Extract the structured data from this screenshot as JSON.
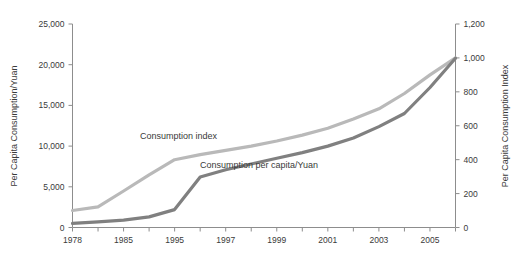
{
  "chart_data": {
    "type": "line",
    "title": "",
    "xlabel": "",
    "ylabel": "Per Capita Consumption/Yuan",
    "y2label": "Per Capita Consumption Index",
    "grid": false,
    "legend_position": "inline-annotations",
    "ylim": [
      0,
      25000
    ],
    "y2lim": [
      0,
      1200
    ],
    "y_ticks": [
      "0",
      "5,000",
      "10,000",
      "15,000",
      "20,000",
      "25,000"
    ],
    "y_tick_values": [
      0,
      5000,
      10000,
      15000,
      20000,
      25000
    ],
    "y2_ticks": [
      "0",
      "200",
      "400",
      "600",
      "800",
      "1,000",
      "1,200"
    ],
    "y2_tick_values": [
      0,
      200,
      400,
      600,
      800,
      1000,
      1200
    ],
    "x_tick_labels": [
      "1978",
      "",
      "1985",
      "",
      "1995",
      "",
      "1997",
      "",
      "1999",
      "",
      "2001",
      "",
      "2003",
      "",
      "2005",
      ""
    ],
    "categories": [
      "1978",
      "1982",
      "1985",
      "1990",
      "1995",
      "1996",
      "1997",
      "1998",
      "1999",
      "2000",
      "2001",
      "2002",
      "2003",
      "2004",
      "2005",
      "2006"
    ],
    "series": [
      {
        "name": "Consumption index",
        "axis": "right",
        "color": "#b9b9b9",
        "values": [
          100,
          122,
          215,
          310,
          400,
          430,
          455,
          480,
          510,
          545,
          585,
          640,
          700,
          790,
          900,
          1000
        ]
      },
      {
        "name": "Consumption per capita/Yuan",
        "axis": "left",
        "color": "#808080",
        "values": [
          500,
          700,
          900,
          1300,
          2200,
          6200,
          7100,
          7800,
          8500,
          9200,
          10000,
          11000,
          12400,
          14000,
          17200,
          20800
        ]
      }
    ],
    "annotations": [
      {
        "text": "Consumption index",
        "x_px": 140,
        "y_px": 139
      },
      {
        "text": "Consumption per capita/Yuan",
        "x_px": 200,
        "y_px": 168
      }
    ]
  },
  "axes": {
    "left_title": "Per Capita Consumption/Yuan",
    "right_title": "Per Capita Consumption Index"
  }
}
